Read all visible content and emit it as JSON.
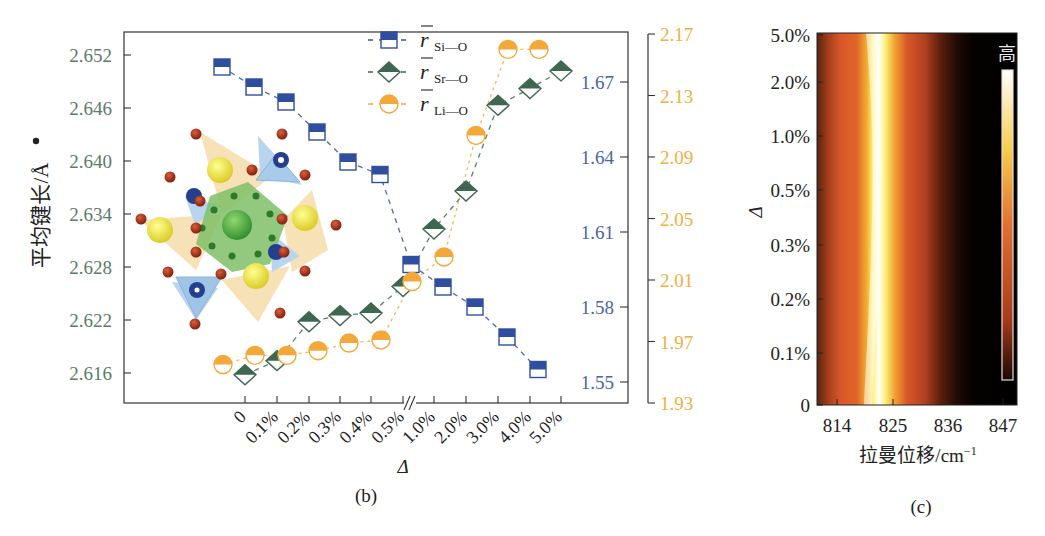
{
  "chart_data": [
    {
      "panel": "(b)",
      "type": "line",
      "xlabel": "Δ",
      "categories": [
        "0",
        "0.1%",
        "0.2%",
        "0.3%",
        "0.4%",
        "0.5%",
        "1.0%",
        "2.0%",
        "3.0%",
        "4.0%",
        "5.0%"
      ],
      "axis_break_after": "0.5%",
      "y_axes": [
        {
          "id": "left",
          "label": "平均键长/Å",
          "color": "#4a6b5a",
          "ticks": [
            "2.616",
            "2.622",
            "2.628",
            "2.634",
            "2.640",
            "2.646",
            "2.652"
          ],
          "range": [
            2.6135,
            2.6555
          ]
        },
        {
          "id": "right_inner",
          "color": "#3d5a9e",
          "ticks": [
            "1.55",
            "1.58",
            "1.61",
            "1.64",
            "1.67"
          ],
          "range": [
            1.545,
            1.688
          ]
        },
        {
          "id": "right_outer",
          "color": "#f0b040",
          "ticks": [
            "1.93",
            "1.97",
            "2.01",
            "2.05",
            "2.09",
            "2.13",
            "2.17"
          ],
          "range": [
            1.93,
            2.17
          ]
        }
      ],
      "series": [
        {
          "name": "r̄ Si—O",
          "label_main": "r",
          "label_sub": "Si—O",
          "axis": "right_inner",
          "marker": "half-filled-square",
          "color": "#2f4f9e",
          "values": [
            1.676,
            1.668,
            1.662,
            1.65,
            1.638,
            1.633,
            1.597,
            1.588,
            1.58,
            1.568,
            1.555
          ]
        },
        {
          "name": "r̄ Sr—O",
          "label_main": "r",
          "label_sub": "Sr—O",
          "axis": "left",
          "marker": "half-filled-diamond",
          "color": "#3f6650",
          "values": [
            2.6158,
            2.6174,
            2.6218,
            2.6225,
            2.6228,
            2.6258,
            2.6323,
            2.6366,
            2.6463,
            2.6482,
            2.6502
          ]
        },
        {
          "name": "r̄ Li—O",
          "label_main": "r",
          "label_sub": "Li—O",
          "axis": "right_outer",
          "marker": "half-filled-circle",
          "color": "#f5a83a",
          "values": [
            1.955,
            1.961,
            1.961,
            1.964,
            1.969,
            1.971,
            2.009,
            2.025,
            2.104,
            2.16,
            2.16
          ]
        }
      ],
      "legend_position": "upper-right inside",
      "grid": false,
      "inset": "crystal structure (polyhedra: green octahedron, yellow/orange and blue tetrahedra, red O atoms)"
    },
    {
      "panel": "(c)",
      "type": "heatmap",
      "xlabel": "拉曼位移/cm⁻¹",
      "ylabel": "Δ",
      "x_ticks": [
        "814",
        "825",
        "836",
        "847"
      ],
      "y_ticks": [
        "0",
        "0.1%",
        "0.2%",
        "0.3%",
        "0.5%",
        "1.0%",
        "2.0%",
        "5.0%"
      ],
      "colorbar_label": "高",
      "peak_center_cm": 822,
      "colormap": "black-red-orange-yellow-white"
    }
  ],
  "labels": {
    "panel_b": "(b)",
    "panel_c": "(c)",
    "b_xlabel": "Δ",
    "b_ylabel": "平均键长/Å",
    "c_xlabel": "拉曼位移/cm",
    "c_xlabel_sup": "−1",
    "c_ylabel": "Δ",
    "colorbar_high": "高"
  }
}
